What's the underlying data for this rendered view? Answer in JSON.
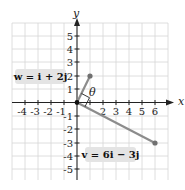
{
  "axes": {
    "x_label": "x",
    "y_label": "y",
    "x_ticks": [
      "-4",
      "-3",
      "-2",
      "-1",
      "2",
      "3",
      "4",
      "5",
      "6"
    ],
    "y_ticks": [
      "5",
      "4",
      "3",
      "2",
      "1",
      "-1",
      "-2",
      "-3",
      "-4",
      "-5"
    ]
  },
  "angle_label": "θ",
  "vectors": [
    {
      "name": "w",
      "label": "w = i + 2j",
      "x": 1,
      "y": 2,
      "color": "#888888"
    },
    {
      "name": "v",
      "label": "v = 6i − 3j",
      "x": 6,
      "y": -3,
      "color": "#888888"
    }
  ],
  "colors": {
    "grid": "#d4d4d4",
    "axis": "#222222",
    "vector": "#8c8c8c",
    "label_bg": "#e6e6e6"
  }
}
